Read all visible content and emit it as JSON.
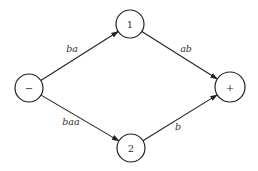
{
  "diagram": {
    "type": "directed-graph",
    "nodes": [
      {
        "id": "minus",
        "label": "−",
        "cx": 29,
        "cy": 88,
        "r": 14
      },
      {
        "id": "n1",
        "label": "1",
        "cx": 130,
        "cy": 24,
        "r": 14
      },
      {
        "id": "n2",
        "label": "2",
        "cx": 131,
        "cy": 148,
        "r": 14
      },
      {
        "id": "plus",
        "label": "+",
        "cx": 230,
        "cy": 87,
        "r": 15
      }
    ],
    "edges": [
      {
        "from": "minus",
        "to": "n1",
        "label": "ba",
        "lx": 72,
        "ly": 52
      },
      {
        "from": "n1",
        "to": "plus",
        "label": "ab",
        "lx": 186,
        "ly": 52
      },
      {
        "from": "minus",
        "to": "n2",
        "label": "baa",
        "lx": 71,
        "ly": 125
      },
      {
        "from": "n2",
        "to": "plus",
        "label": "b",
        "lx": 178,
        "ly": 130
      }
    ]
  }
}
